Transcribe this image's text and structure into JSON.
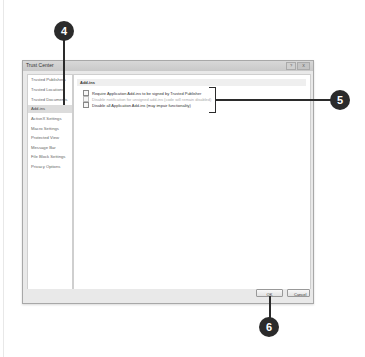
{
  "dialog": {
    "title": "Trust Center",
    "window_buttons": [
      "?",
      "X"
    ]
  },
  "sidebar": {
    "items": [
      {
        "label": "Trusted Publishers",
        "selected": false
      },
      {
        "label": "Trusted Locations",
        "selected": false
      },
      {
        "label": "Trusted Documents",
        "selected": false
      },
      {
        "label": "Add-ins",
        "selected": true
      },
      {
        "label": "ActiveX Settings",
        "selected": false
      },
      {
        "label": "Macro Settings",
        "selected": false
      },
      {
        "label": "Protected View",
        "selected": false
      },
      {
        "label": "Message Bar",
        "selected": false
      },
      {
        "label": "File Block Settings",
        "selected": false
      },
      {
        "label": "Privacy Options",
        "selected": false
      }
    ]
  },
  "main": {
    "section_title": "Add-ins",
    "options": [
      {
        "label": "Require Application Add-ins to be signed by Trusted Publisher",
        "checked": false,
        "enabled": true
      },
      {
        "label": "Disable notification for unsigned add-ins (code will remain disabled)",
        "checked": false,
        "enabled": false
      },
      {
        "label": "Disable all Application Add-ins (may impair functionality)",
        "checked": false,
        "enabled": true
      }
    ]
  },
  "footer": {
    "ok_label": "OK",
    "cancel_label": "Cancel"
  },
  "callouts": {
    "c4": "4",
    "c5": "5",
    "c6": "6"
  }
}
